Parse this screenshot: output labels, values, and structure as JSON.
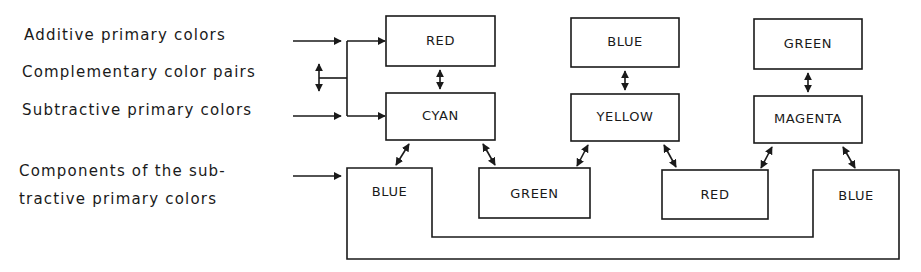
{
  "legend": {
    "additive": "Additive primary colors",
    "complementary": "Complementary color pairs",
    "subtractive": "Subtractive primary colors",
    "components_line1": "Components of the sub-",
    "components_line2": "tractive primary colors"
  },
  "additive_row": [
    {
      "label": "RED"
    },
    {
      "label": "BLUE"
    },
    {
      "label": "GREEN"
    }
  ],
  "subtractive_row": [
    {
      "label": "CYAN"
    },
    {
      "label": "YELLOW"
    },
    {
      "label": "MAGENTA"
    }
  ],
  "components_row": [
    {
      "label": "BLUE"
    },
    {
      "label": "GREEN"
    },
    {
      "label": "RED"
    },
    {
      "label": "BLUE"
    }
  ],
  "colors": {
    "line": "#1a1a1a",
    "background": "#ffffff"
  }
}
